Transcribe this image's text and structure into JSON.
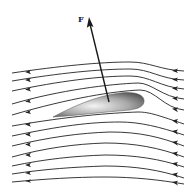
{
  "diagram": {
    "force": {
      "label": "F",
      "color": "#1a1a1a"
    },
    "flow_direction": "right-to-left",
    "streamline_color": "#222222",
    "airfoil": {
      "fill_dark": "#5a5a5a",
      "fill_light": "#f0f0f0"
    },
    "streamlines_above_count": 5,
    "streamlines_below_count": 7
  }
}
